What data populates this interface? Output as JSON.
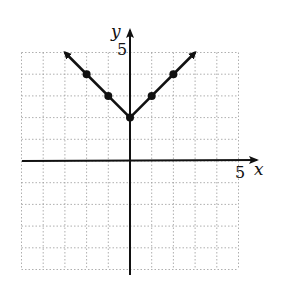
{
  "chart_data": {
    "type": "line",
    "title": "",
    "function": "y = |x| + 2",
    "xlabel": "x",
    "ylabel": "y",
    "xlim": [
      -5,
      5
    ],
    "ylim": [
      -5,
      5
    ],
    "grid": true,
    "x_tick_labels": [
      {
        "value": 5,
        "label": "5"
      }
    ],
    "y_tick_labels": [
      {
        "value": 5,
        "label": "5"
      }
    ],
    "series": [
      {
        "name": "V-shaped graph",
        "x": [
          -3,
          -2,
          -1,
          0,
          1,
          2,
          3
        ],
        "y": [
          5,
          4,
          3,
          2,
          3,
          4,
          5
        ],
        "plotted_points": [
          [
            -2,
            4
          ],
          [
            -1,
            3
          ],
          [
            0,
            2
          ],
          [
            1,
            3
          ],
          [
            2,
            4
          ]
        ],
        "arrows_at": [
          [
            -3,
            5
          ],
          [
            3,
            5
          ]
        ]
      }
    ]
  },
  "labels": {
    "x_axis": "x",
    "y_axis": "y",
    "x_tick": "5",
    "y_tick": "5"
  },
  "colors": {
    "ink": "#111111",
    "grid": "#9a9a9a",
    "background": "#ffffff"
  }
}
